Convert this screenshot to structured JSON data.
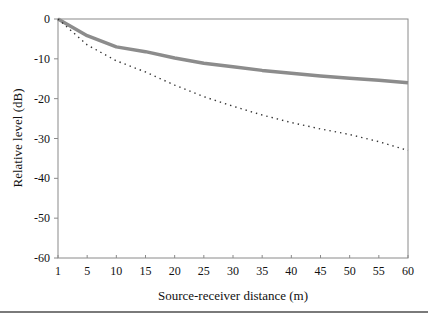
{
  "chart_data": {
    "type": "line",
    "title": "",
    "xlabel": "Source-receiver distance (m)",
    "ylabel": "Relative level (dB)",
    "categories": [
      "1",
      "5",
      "10",
      "15",
      "20",
      "25",
      "30",
      "35",
      "40",
      "45",
      "50",
      "55",
      "60"
    ],
    "x": [
      1,
      5,
      10,
      15,
      20,
      25,
      30,
      35,
      40,
      45,
      50,
      55,
      60
    ],
    "ylim": [
      -60,
      0
    ],
    "yticks": [
      0,
      -10,
      -20,
      -30,
      -40,
      -50,
      -60
    ],
    "grid": false,
    "legend": null,
    "series": [
      {
        "name": "Solid grey curve",
        "style": "solid",
        "color": "#8c8c8c",
        "values": [
          0,
          -4.2,
          -7.0,
          -8.2,
          -9.8,
          -11.1,
          -12.0,
          -12.9,
          -13.6,
          -14.3,
          -14.9,
          -15.4,
          -16.0
        ]
      },
      {
        "name": "Dotted curve",
        "style": "dotted",
        "color": "#333333",
        "values": [
          0,
          -6.5,
          -10.5,
          -13.3,
          -16.6,
          -19.5,
          -21.9,
          -24.1,
          -26.0,
          -27.6,
          -29.0,
          -30.8,
          -33.0
        ]
      }
    ]
  }
}
